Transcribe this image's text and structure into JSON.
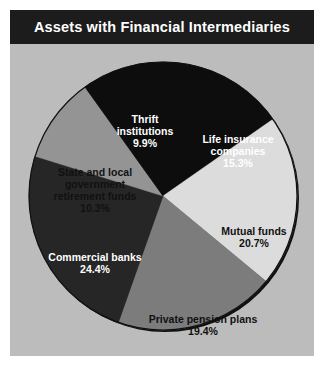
{
  "header": {
    "title": "Assets with Financial Intermediaries"
  },
  "colors": {
    "page_background": "#ffffff",
    "title_bar": "#1c1c1c",
    "panel_background": "#bcbcbc",
    "pie_outline": "#101010"
  },
  "chart_data": {
    "type": "pie",
    "title": "Assets with Financial Intermediaries",
    "subtitle": "",
    "xlabel": "",
    "ylabel": "",
    "legend_position": "none",
    "grid": false,
    "value_unit": "percent",
    "start_angle_deg": 0,
    "direction": "clockwise",
    "total": 100.0,
    "categories": [
      "Life insurance companies",
      "Mutual funds",
      "Private pension plans",
      "Commercial banks",
      "State and local government retirement funds",
      "Thrift institutions"
    ],
    "values": [
      15.3,
      20.7,
      19.4,
      24.4,
      10.3,
      9.9
    ],
    "slices": [
      {
        "name": "life-insurance-companies",
        "label_line1": "Life insurance",
        "label_line2": "companies",
        "label_line3": "",
        "value": 15.3,
        "value_text": "15.3%",
        "color": "#0d0d0d",
        "label_color": "light"
      },
      {
        "name": "mutual-funds",
        "label_line1": "Mutual funds",
        "label_line2": "",
        "label_line3": "",
        "value": 20.7,
        "value_text": "20.7%",
        "color": "#dcdcdc",
        "label_color": "dark"
      },
      {
        "name": "private-pension-plans",
        "label_line1": "Private pension plans",
        "label_line2": "",
        "label_line3": "",
        "value": 19.4,
        "value_text": "19.4%",
        "color": "#7c7c7c",
        "label_color": "dark"
      },
      {
        "name": "commercial-banks",
        "label_line1": "Commercial banks",
        "label_line2": "",
        "label_line3": "",
        "value": 24.4,
        "value_text": "24.4%",
        "color": "#262626",
        "label_color": "light"
      },
      {
        "name": "state-local-government-retirement-funds",
        "label_line1": "State and local",
        "label_line2": "government",
        "label_line3": "retirement funds",
        "value": 10.3,
        "value_text": "10.3%",
        "color": "#949494",
        "label_color": "dark"
      },
      {
        "name": "thrift-institutions",
        "label_line1": "Thrift",
        "label_line2": "institutions",
        "label_line3": "",
        "value": 9.9,
        "value_text": "9.9%",
        "color": "#0d0d0d",
        "label_color": "light"
      }
    ]
  }
}
